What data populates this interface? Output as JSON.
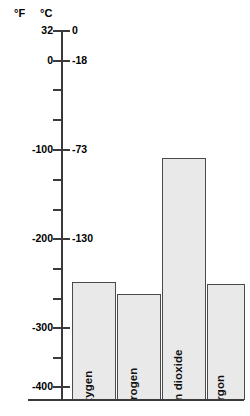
{
  "chart_data": {
    "type": "bar",
    "title": "",
    "subtitle": "",
    "xlabel": "",
    "ylabel": "",
    "categories": [
      "oxygen",
      "nitrogen",
      "carbon dioxide",
      "argon"
    ],
    "values_celsius": [
      -184,
      -196,
      -78,
      -186
    ],
    "values_fahrenheit": [
      -300,
      -320,
      -109,
      -303
    ],
    "series": [
      {
        "name": "temperature",
        "unit": "°C",
        "values": [
          -184,
          -196,
          -78,
          -186
        ]
      }
    ],
    "grid": false,
    "legend": null,
    "axes": {
      "fahrenheit": {
        "label": "°F",
        "ticks": [
          32,
          0,
          -100,
          -200,
          -300,
          -400
        ],
        "tick_labels": [
          "32",
          "0",
          "-100",
          "-200",
          "-300",
          "-400"
        ],
        "lim": [
          -440,
          32
        ]
      },
      "celsius": {
        "label": "°C",
        "ticks": [
          0,
          -18,
          -73,
          -130,
          -184,
          -240
        ],
        "tick_labels": [
          "0",
          "-18",
          "-73",
          "-130",
          "-184",
          "-240"
        ],
        "lim": [
          -262,
          0
        ]
      }
    }
  },
  "axis": {
    "unit_f": "°F",
    "unit_c": "°C",
    "rows": [
      {
        "f": "32",
        "c": "0",
        "y": 31,
        "minor": false
      },
      {
        "f": "0",
        "c": "-18",
        "y": 61,
        "minor": false
      },
      {
        "f": "",
        "c": "",
        "y": 90,
        "minor": true
      },
      {
        "f": "",
        "c": "",
        "y": 120,
        "minor": true
      },
      {
        "f": "-100",
        "c": "-73",
        "y": 150,
        "minor": false
      },
      {
        "f": "",
        "c": "",
        "y": 180,
        "minor": true
      },
      {
        "f": "",
        "c": "",
        "y": 210,
        "minor": true
      },
      {
        "f": "-200",
        "c": "-130",
        "y": 239,
        "minor": false
      },
      {
        "f": "",
        "c": "",
        "y": 269,
        "minor": true
      },
      {
        "f": "",
        "c": "",
        "y": 299,
        "minor": true
      },
      {
        "f": "-300",
        "c": "-184",
        "y": 328,
        "minor": false
      },
      {
        "f": "",
        "c": "",
        "y": 358,
        "minor": true
      },
      {
        "f": "-400",
        "c": "-240",
        "y": 387,
        "minor": false
      }
    ]
  },
  "bars": [
    {
      "label": "oxygen",
      "left": 72,
      "width": 44,
      "height": 118
    },
    {
      "label": "nitrogen",
      "left": 117,
      "width": 44,
      "height": 106
    },
    {
      "label": "carbon dioxide",
      "left": 162,
      "width": 44,
      "height": 242
    },
    {
      "label": "argon",
      "left": 207,
      "width": 38,
      "height": 116
    }
  ]
}
